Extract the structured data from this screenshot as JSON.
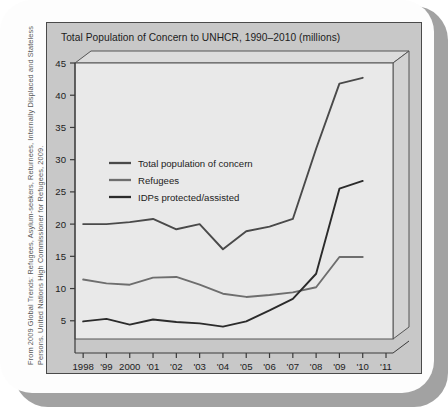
{
  "caption": {
    "line1": "From 2009 Global Trends: Refugees, Asylum-seekers, Returnees, Internally Displaced and Stateless",
    "line2": "Persons. United Nations High Commissioner for Refugees, 2009."
  },
  "colors": {
    "panel_background": "#c8c8c8",
    "plot_background": "#e8e8e8",
    "plot_wall": "#d8d8d8",
    "line_total": "#4a4a4a",
    "line_refugees": "#6e6e6e",
    "line_idps": "#2b2b2b",
    "axis": "#3a3a3a",
    "card": "#fdfdfd",
    "shadow": "#a2a2a2"
  },
  "chart_data": {
    "type": "line",
    "title": "Total Population of Concern to UNHCR, 1990–2010 (millions)",
    "xlabel": "",
    "ylabel": "",
    "ylim": [
      0,
      45
    ],
    "yticks": [
      5,
      10,
      15,
      20,
      25,
      30,
      35,
      40,
      45
    ],
    "ytick_labels": [
      "5",
      "10",
      "15",
      "20",
      "25",
      "30",
      "35",
      "40",
      "45"
    ],
    "grid": false,
    "legend_position": "upper-left-inside",
    "x": [
      1998,
      1999,
      2000,
      2001,
      2002,
      2003,
      2004,
      2005,
      2006,
      2007,
      2008,
      2009,
      2010
    ],
    "xtick_labels": [
      "1998",
      "'99",
      "2000",
      "'01",
      "'02",
      "'03",
      "'04",
      "'05",
      "'06",
      "'07",
      "'08",
      "'09",
      "'10",
      "'11"
    ],
    "series": [
      {
        "name": "Total population of concern",
        "color": "#4a4a4a",
        "values": [
          20.0,
          20.0,
          20.3,
          20.8,
          19.2,
          20.0,
          16.1,
          18.9,
          19.6,
          20.8,
          31.7,
          41.8,
          42.7
        ]
      },
      {
        "name": "Refugees",
        "color": "#6e6e6e",
        "values": [
          11.4,
          10.8,
          10.6,
          11.7,
          11.8,
          10.6,
          9.2,
          8.7,
          9.0,
          9.4,
          10.2,
          14.9,
          14.9
        ]
      },
      {
        "name": "IDPs protected/assisted",
        "color": "#2b2b2b",
        "values": [
          4.9,
          5.3,
          4.4,
          5.2,
          4.8,
          4.6,
          4.1,
          4.9,
          6.6,
          8.4,
          12.3,
          25.5,
          26.7
        ]
      }
    ]
  },
  "legend": {
    "items": [
      {
        "label": "Total population of concern"
      },
      {
        "label": "Refugees"
      },
      {
        "label": "IDPs protected/assisted"
      }
    ]
  }
}
